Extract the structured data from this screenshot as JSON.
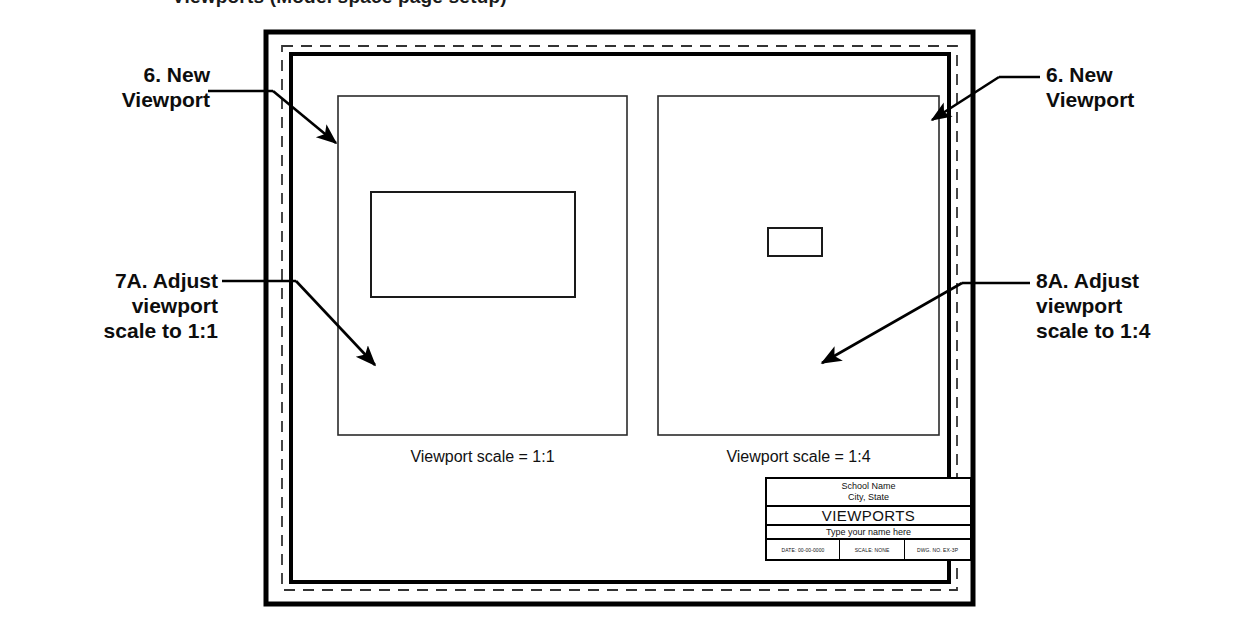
{
  "page": {
    "truncated_heading": "Viewports  (Model space page setup)",
    "background_color": "#ffffff",
    "ink_color": "#000000"
  },
  "callouts": [
    {
      "id": "callout-6-left",
      "text": "6.  New\nViewport",
      "side": "left"
    },
    {
      "id": "callout-6-right",
      "text": "6.  New\nViewport",
      "side": "right"
    },
    {
      "id": "callout-7a",
      "text": "7A. Adjust\nviewport\nscale to 1:1",
      "side": "left"
    },
    {
      "id": "callout-8a",
      "text": "8A. Adjust\nviewport\nscale to 1:4",
      "side": "right"
    }
  ],
  "drawing": {
    "sheet_label": "paper-space-sheet",
    "printable_area_label": "printable-area-dashed-margin",
    "frame_label": "drawing-frame-border",
    "viewports": [
      {
        "id": "viewport-left",
        "caption": "Viewport scale = 1:1",
        "scale": "1:1",
        "content_object": "rectangle"
      },
      {
        "id": "viewport-right",
        "caption": "Viewport scale = 1:4",
        "scale": "1:4",
        "content_object": "rectangle"
      }
    ]
  },
  "title_block": {
    "school_name": "School Name",
    "city_state": "City, State",
    "drawing_title": "VIEWPORTS",
    "name_field": "Type your name here",
    "date": "DATE: 00-00-0000",
    "scale": "SCALE: NONE",
    "dwg_no": "DWG. NO. EX-3P"
  }
}
